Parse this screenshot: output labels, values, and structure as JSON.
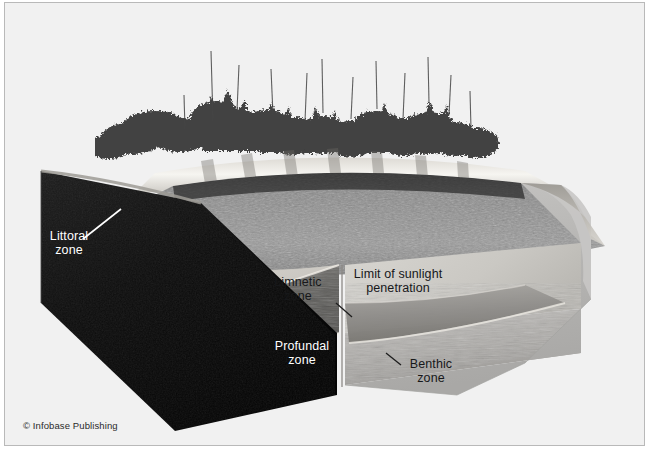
{
  "figure": {
    "credit": "© Infobase Publishing",
    "background_color": "#f2f2f2",
    "frame_color": "#b9b9b9"
  },
  "labels": {
    "littoral": {
      "text": "Littoral\nzone",
      "color": "#ffffff"
    },
    "limnetic": {
      "text": "Limnetic\nzone",
      "color": "#17181a"
    },
    "sunlight": {
      "text": "Limit of sunlight\npenetration",
      "color": "#17181a"
    },
    "profundal": {
      "text": "Profundal\nzone",
      "color": "#ffffff"
    },
    "benthic": {
      "text": "Benthic\nzone",
      "color": "#17181a"
    }
  },
  "scene": {
    "sky_color": "#f0f0f0",
    "tree_color": "#3a3a3a",
    "shore_color": "#f4f2ee",
    "water_surface_color": "#8e8e8e",
    "littoral_shelf_color": "#d9d6d0",
    "limnetic_face_color": "#cfcdc8",
    "profundal_band_color": "#6d6c69",
    "benthic_face_color": "#b4b4b2",
    "soil_block_color": "#141414",
    "right_block_color": "#b9b9b7"
  }
}
